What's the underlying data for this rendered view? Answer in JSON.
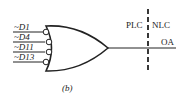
{
  "diagram": {
    "caption": "(b)",
    "gate": {
      "type": "OR",
      "inverted_inputs": true
    },
    "inputs": [
      {
        "label": "~D1"
      },
      {
        "label": "~D4"
      },
      {
        "label": "~D11"
      },
      {
        "label": "~D13"
      }
    ],
    "output": {
      "label": "OA"
    },
    "boundary": {
      "left_label": "PLC",
      "right_label": "NLC"
    },
    "colors": {
      "stroke": "#222222",
      "background": "#ffffff"
    }
  }
}
